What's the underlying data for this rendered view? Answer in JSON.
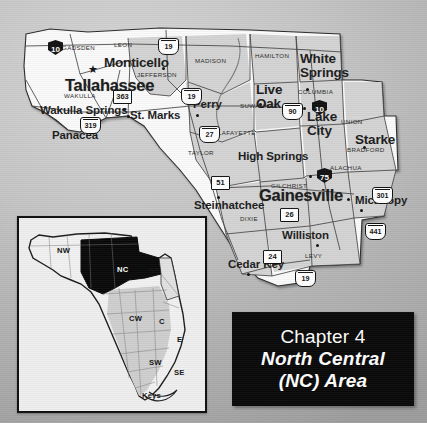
{
  "document": {
    "title": "Chapter 4 North Central (NC) Area",
    "type": "regional road map"
  },
  "chapter_plate": {
    "line1": "Chapter 4",
    "line2": "North Central",
    "line3": "(NC) Area",
    "background_color": "#080808",
    "text_color": "#ffffff"
  },
  "map": {
    "capital_star_label": "state-capital-star",
    "counties": [
      {
        "name": "GADSDEN",
        "x": 52,
        "y": 25
      },
      {
        "name": "LEON",
        "x": 104,
        "y": 22
      },
      {
        "name": "JEFFERSON",
        "x": 127,
        "y": 52
      },
      {
        "name": "MADISON",
        "x": 185,
        "y": 38
      },
      {
        "name": "HAMILTON",
        "x": 245,
        "y": 33
      },
      {
        "name": "COLUMBIA",
        "x": 288,
        "y": 69
      },
      {
        "name": "WAKULLA",
        "x": 54,
        "y": 73
      },
      {
        "name": "SUWANNEE",
        "x": 230,
        "y": 83
      },
      {
        "name": "UNION",
        "x": 331,
        "y": 99
      },
      {
        "name": "LAFAYETTE",
        "x": 208,
        "y": 110
      },
      {
        "name": "BRADFORD",
        "x": 337,
        "y": 127
      },
      {
        "name": "TAYLOR",
        "x": 178,
        "y": 130
      },
      {
        "name": "ALACHUA",
        "x": 320,
        "y": 145
      },
      {
        "name": "GILCHRIST",
        "x": 261,
        "y": 163
      },
      {
        "name": "DIXIE",
        "x": 230,
        "y": 196
      },
      {
        "name": "LEVY",
        "x": 295,
        "y": 233
      }
    ],
    "cities": [
      {
        "name": "Tallahassee",
        "size": "xl",
        "x": 55,
        "y": 57,
        "dot": false,
        "star": true
      },
      {
        "name": "Gainesville",
        "size": "xl",
        "x": 249,
        "y": 167,
        "dot": true
      },
      {
        "name": "Monticello",
        "size": "lg",
        "x": 94,
        "y": 36,
        "dot": true
      },
      {
        "name": "White Springs",
        "size": "lg",
        "x": 290,
        "y": 32,
        "dot": true,
        "two_line": true
      },
      {
        "name": "Live Oak",
        "size": "lg",
        "x": 246,
        "y": 63,
        "dot": true,
        "two_line": true
      },
      {
        "name": "Lake City",
        "size": "lg",
        "x": 297,
        "y": 90,
        "dot": true,
        "two_line": true
      },
      {
        "name": "Starke",
        "size": "lg",
        "x": 345,
        "y": 113,
        "dot": true
      },
      {
        "name": "High Springs",
        "size": "md",
        "x": 228,
        "y": 131,
        "dot": true
      },
      {
        "name": "Micanopy",
        "size": "md",
        "x": 345,
        "y": 175,
        "dot": true
      },
      {
        "name": "Perry",
        "size": "md",
        "x": 183,
        "y": 79,
        "dot": true
      },
      {
        "name": "St. Marks",
        "size": "md",
        "x": 120,
        "y": 90,
        "dot": true
      },
      {
        "name": "Wakulla Springs",
        "size": "md",
        "x": 30,
        "y": 85,
        "dot": true
      },
      {
        "name": "Panacea",
        "size": "md",
        "x": 42,
        "y": 110,
        "dot": true
      },
      {
        "name": "Steinhatchee",
        "size": "md",
        "x": 184,
        "y": 180,
        "dot": true
      },
      {
        "name": "Williston",
        "size": "md",
        "x": 272,
        "y": 210,
        "dot": true
      },
      {
        "name": "Cedar Key",
        "size": "md",
        "x": 218,
        "y": 239,
        "dot": true
      }
    ],
    "highway_shields": [
      {
        "number": "10",
        "type": "interstate",
        "x": 38,
        "y": 20
      },
      {
        "number": "19",
        "type": "us",
        "x": 148,
        "y": 18
      },
      {
        "number": "363",
        "type": "state",
        "x": 103,
        "y": 70
      },
      {
        "number": "19",
        "type": "us",
        "x": 171,
        "y": 68
      },
      {
        "number": "319",
        "type": "us",
        "x": 70,
        "y": 97
      },
      {
        "number": "27",
        "type": "us",
        "x": 189,
        "y": 106
      },
      {
        "number": "90",
        "type": "us",
        "x": 272,
        "y": 83
      },
      {
        "number": "10",
        "type": "interstate",
        "x": 302,
        "y": 80
      },
      {
        "number": "75",
        "type": "interstate",
        "x": 307,
        "y": 148
      },
      {
        "number": "51",
        "type": "state",
        "x": 201,
        "y": 156
      },
      {
        "number": "301",
        "type": "us",
        "x": 362,
        "y": 167
      },
      {
        "number": "26",
        "type": "state",
        "x": 270,
        "y": 188
      },
      {
        "number": "441",
        "type": "us",
        "x": 355,
        "y": 203
      },
      {
        "number": "24",
        "type": "state",
        "x": 253,
        "y": 230
      },
      {
        "number": "19",
        "type": "us",
        "x": 285,
        "y": 250
      }
    ]
  },
  "inset_map": {
    "title": "Florida regions locator",
    "highlighted_region": "NC",
    "regions": [
      {
        "code": "NW",
        "x": 38,
        "y": 28,
        "on_dark": false
      },
      {
        "code": "NC",
        "x": 98,
        "y": 47,
        "on_dark": true
      },
      {
        "code": "NE",
        "x": 130,
        "y": 48,
        "on_dark": false
      },
      {
        "code": "CW",
        "x": 110,
        "y": 96,
        "on_dark": false
      },
      {
        "code": "C",
        "x": 140,
        "y": 99,
        "on_dark": false
      },
      {
        "code": "E",
        "x": 158,
        "y": 117,
        "on_dark": false
      },
      {
        "code": "SW",
        "x": 130,
        "y": 140,
        "on_dark": false
      },
      {
        "code": "SE",
        "x": 155,
        "y": 150,
        "on_dark": false
      },
      {
        "code": "Keys",
        "x": 123,
        "y": 173,
        "on_dark": false
      }
    ]
  },
  "colors": {
    "background": "#c6c6c6",
    "land_light": "#fbfbfb",
    "land_shade": "#d2d2d2",
    "ink": "#111111",
    "highlight": "#050505"
  }
}
